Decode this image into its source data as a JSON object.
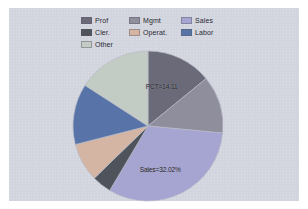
{
  "figure": {
    "background_color": "#d2d4de",
    "outer_background": "#ffffff"
  },
  "legend": {
    "position": "top-center",
    "entries": [
      {
        "label": "Prof",
        "color": "#6b6a78",
        "column": 1,
        "row": 1
      },
      {
        "label": "Cler.",
        "color": "#4e535c",
        "column": 1,
        "row": 2
      },
      {
        "label": "Other",
        "color": "#c2cbc4",
        "column": 1,
        "row": 3
      },
      {
        "label": "Mgmt",
        "color": "#8e8e9c",
        "column": 2,
        "row": 1
      },
      {
        "label": "Operat.",
        "color": "#d4b5a3",
        "column": 2,
        "row": 2
      },
      {
        "label": "Sales",
        "color": "#a6a4d0",
        "column": 3,
        "row": 1
      },
      {
        "label": "Labor",
        "color": "#5773a8",
        "column": 3,
        "row": 2
      }
    ]
  },
  "chart_data": {
    "type": "pie",
    "title": "",
    "subtitle": "",
    "xlabel": "",
    "ylabel": "",
    "legend_position": "top-center",
    "grid": false,
    "start_angle_deg": 0,
    "direction": "clockwise",
    "categories": [
      "Prof",
      "Mgmt",
      "Sales",
      "Cler.",
      "Operat.",
      "Labor",
      "Other"
    ],
    "values": [
      14.11,
      12.4,
      32.02,
      4.2,
      8.3,
      13.1,
      15.87
    ],
    "units": "percent",
    "slices": [
      {
        "label": "Prof",
        "percent": 14.11,
        "color": "#6b6a78"
      },
      {
        "label": "Mgmt",
        "percent": 12.4,
        "color": "#8e8e9c"
      },
      {
        "label": "Sales",
        "percent": 32.02,
        "color": "#a6a4d0"
      },
      {
        "label": "Cler.",
        "percent": 4.2,
        "color": "#4e535c"
      },
      {
        "label": "Operat.",
        "percent": 8.3,
        "color": "#d4b5a3"
      },
      {
        "label": "Labor",
        "percent": 13.1,
        "color": "#5773a8"
      },
      {
        "label": "Other",
        "percent": 15.87,
        "color": "#c2cbc4"
      }
    ],
    "annotations": [
      {
        "text": "PCT=14.11",
        "x_pct": 59,
        "y_pct": 24,
        "for_slice": "Prof"
      },
      {
        "text": "Sales=32.02%",
        "x_pct": 58,
        "y_pct": 78,
        "for_slice": "Sales"
      }
    ]
  }
}
